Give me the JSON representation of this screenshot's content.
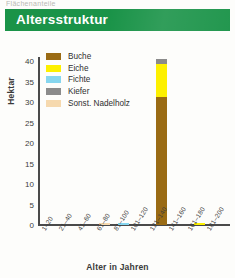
{
  "page": {
    "cutoff_text": "Flächenanteile"
  },
  "header": {
    "title": "Altersstruktur"
  },
  "legend": {
    "items": [
      {
        "label": "Buche",
        "color": "#9a6b14"
      },
      {
        "label": "Eiche",
        "color": "#fdf000"
      },
      {
        "label": "Fichte",
        "color": "#86d6ef"
      },
      {
        "label": "Kiefer",
        "color": "#8b8b8b"
      },
      {
        "label": "Sonst. Nadelholz",
        "color": "#f6d9ae"
      }
    ]
  },
  "chart_data": {
    "type": "bar",
    "stacked": true,
    "title": "Altersstruktur",
    "xlabel": "Alter in Jahren",
    "ylabel": "Hektar",
    "ylim": [
      0,
      41
    ],
    "yticks": [
      40,
      35,
      30,
      25,
      20,
      15,
      10,
      5,
      0
    ],
    "grid": false,
    "legend_position": "top-left-inside",
    "categories": [
      "1–20",
      "21–40",
      "41–60",
      "61–80",
      "81–100",
      "101–120",
      "121–140",
      "141–160",
      "161–180",
      "181–200"
    ],
    "series": [
      {
        "name": "Buche",
        "color": "#9a6b14",
        "values": [
          0,
          0,
          0,
          0,
          0,
          0,
          31.3,
          0,
          0,
          0
        ]
      },
      {
        "name": "Eiche",
        "color": "#fdf000",
        "values": [
          0,
          0,
          0,
          0,
          0,
          0,
          8.0,
          0,
          0.6,
          0
        ]
      },
      {
        "name": "Fichte",
        "color": "#86d6ef",
        "values": [
          0,
          0,
          0,
          0,
          0.4,
          0,
          0,
          0,
          0,
          0
        ]
      },
      {
        "name": "Kiefer",
        "color": "#8b8b8b",
        "values": [
          0,
          0,
          0,
          0,
          0,
          0,
          1.2,
          0,
          0,
          0
        ]
      },
      {
        "name": "Sonst. Nadelholz",
        "color": "#f6d9ae",
        "values": [
          0,
          0,
          0,
          0.5,
          0,
          0,
          0,
          0,
          0,
          0
        ]
      }
    ]
  }
}
